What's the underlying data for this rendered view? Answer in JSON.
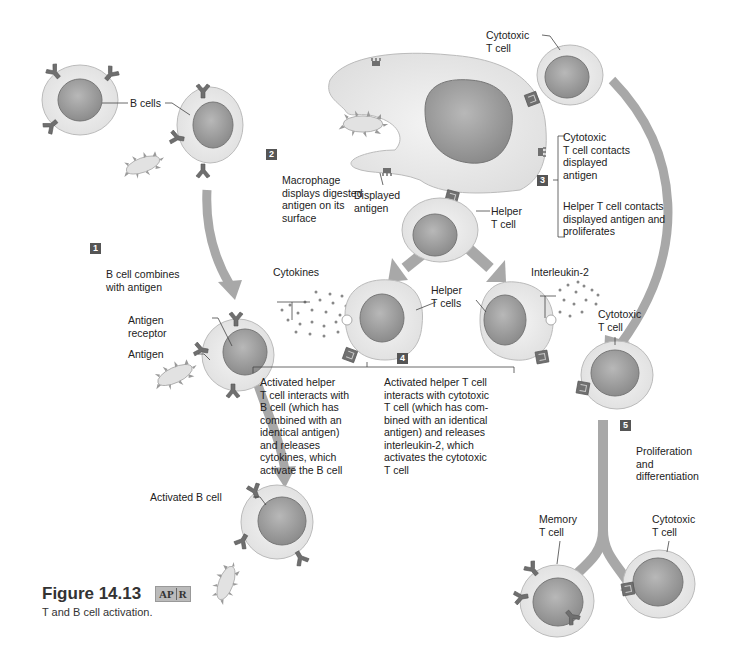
{
  "figure": {
    "number": "Figure 14.13",
    "badge": {
      "left": "AP",
      "right": "R"
    },
    "caption": "T and B cell activation."
  },
  "labels": {
    "b_cells": "B cells",
    "cytotoxic_t_cell_top": "Cytotoxic\nT cell",
    "displayed_antigen": "Displayed\nantigen",
    "helper_t_cell": "Helper\nT cell",
    "antigen_receptor": "Antigen\nreceptor",
    "antigen": "Antigen",
    "cytokines": "Cytokines",
    "helper_t_cells": "Helper\nT cells",
    "interleukin_2": "Interleukin-2",
    "cytotoxic_t_cell_mid": "Cytotoxic\nT cell",
    "activated_b_cell": "Activated B cell",
    "memory_t_cell": "Memory\nT cell",
    "cytotoxic_t_cell_bottom": "Cytotoxic\nT cell"
  },
  "steps": [
    {
      "num": "1",
      "text": "B cell combines\nwith antigen"
    },
    {
      "num": "2",
      "text": "Macrophage\ndisplays digested\nantigen on its\nsurface"
    },
    {
      "num": "3",
      "text_a": "Cytotoxic\nT cell contacts\ndisplayed\nantigen",
      "text_b": "Helper T cell contacts\ndisplayed antigen and\nproliferates"
    },
    {
      "num": "4",
      "text_a": "Activated helper\nT cell interacts with\nB cell (which has\ncombined with an\nidentical  antigen)\nand releases\ncytokines, which\nactivate the B cell",
      "text_b": "Activated helper  T cell\ninteracts with cytotoxic\nT cell (which has com-\nbined with an identical\nantigen) and releases\ninterleukin-2, which\nactivates the cytotoxic\nT cell"
    },
    {
      "num": "5",
      "text": "Proliferation\nand\ndifferentiation"
    }
  ],
  "colors": {
    "cell_body": "#ececec",
    "nucleus": "#9a9a9a",
    "arrow": "#a8a8a8",
    "receptor": "#777777",
    "badge_bg": "#555555"
  }
}
